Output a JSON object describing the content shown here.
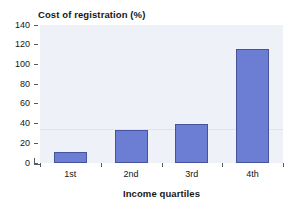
{
  "chart_data": {
    "type": "bar",
    "title": "Cost of registration (%)",
    "xlabel": "Income quartiles",
    "ylabel": "",
    "categories": [
      "1st",
      "2nd",
      "3rd",
      "4th"
    ],
    "values": [
      11,
      33,
      40,
      116
    ],
    "ylim": [
      0,
      140
    ],
    "yticks": [
      0,
      20,
      40,
      60,
      80,
      100,
      120,
      140
    ],
    "ytick_labels": [
      "0",
      "20",
      "40",
      "60",
      "80",
      "100",
      "120",
      "140"
    ],
    "grid": false,
    "legend": null,
    "annotations": [
      {
        "name": "reference-line",
        "value": 33,
        "style": "faint-horizontal"
      }
    ],
    "colors": {
      "bar_fill": "#6b7ed3",
      "bar_border": "#46539c",
      "plot_background": "#eef1f7",
      "axis": "#555a66",
      "text": "#161616",
      "reference_line": "#dfe3ee"
    }
  }
}
